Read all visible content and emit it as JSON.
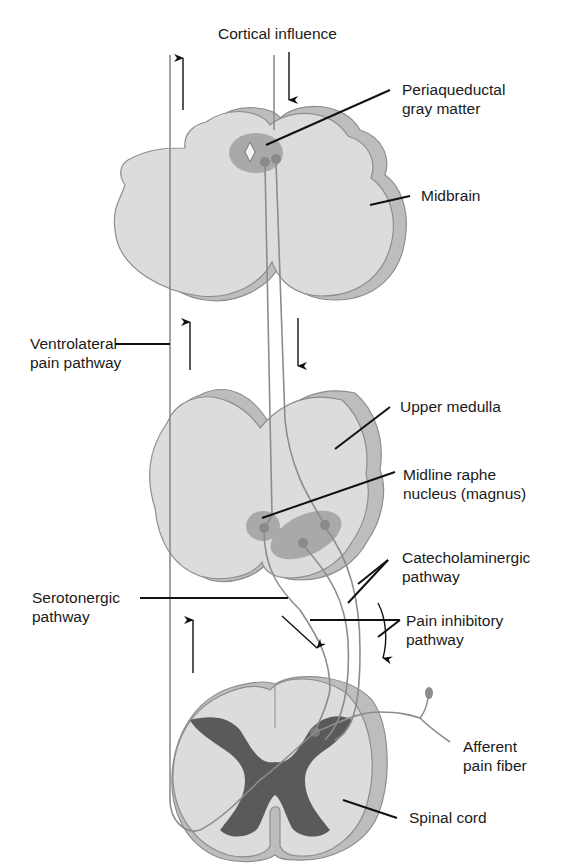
{
  "title": "Cortical influence",
  "labels": {
    "pag_line1": "Periaqueductal",
    "pag_line2": "gray matter",
    "midbrain": "Midbrain",
    "vl_line1": "Ventrolateral",
    "vl_line2": "pain pathway",
    "upper_medulla": "Upper medulla",
    "raphe_line1": "Midline raphe",
    "raphe_line2": "nucleus (magnus)",
    "cat_line1": "Catecholaminergic",
    "cat_line2": "pathway",
    "sero_line1": "Serotonergic",
    "sero_line2": "pathway",
    "inhib_line1": "Pain inhibitory",
    "inhib_line2": "pathway",
    "afferent_line1": "Afferent",
    "afferent_line2": "pain fiber",
    "spinal_cord": "Spinal cord"
  },
  "colors": {
    "tissue": "#dcdcdc",
    "tissue_shadow": "#bdbdbd",
    "outline": "#8e8e8e",
    "nucleus_halo": "#a9a9a9",
    "nucleus_core": "#8a8a8a",
    "gray_matter": "#5a5a5a",
    "fiber": "#8c8c8c",
    "leader": "#111111"
  }
}
